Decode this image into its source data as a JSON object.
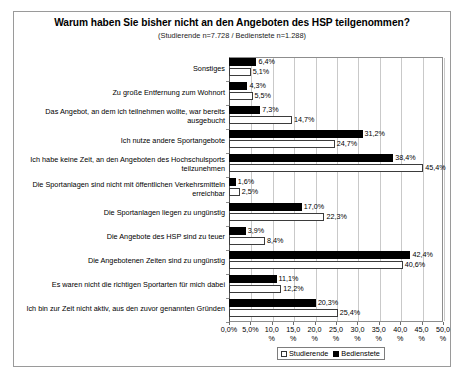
{
  "chart_data": {
    "type": "bar",
    "orientation": "horizontal",
    "title": "Warum haben Sie bisher nicht an den Angeboten des HSP teilgenommen?",
    "subtitle": "(Studierende n=7.728 / Bedienstete n=1.288)",
    "xlabel": "",
    "ylabel": "",
    "xlim": [
      0,
      50
    ],
    "grid": true,
    "legend_position": "bottom",
    "value_suffix": "%",
    "decimal_separator": ",",
    "categories": [
      "Sonstiges",
      "Zu große Entfernung zum Wohnort",
      "Das Angebot, an dem ich teilnehmen wollte, war bereits ausgebucht",
      "Ich nutze andere Sportangebote",
      "Ich habe keine Zeit, an den Angeboten des Hochschulsports teilzunehmen",
      "Die Sportanlagen sind nicht mit öffentlichen Verkehrsmitteln erreichbar",
      "Die Sportanlagen liegen zu ungünstig",
      "Die Angebote des HSP sind zu teuer",
      "Die Angebotenen Zeiten sind zu ungünstig",
      "Es waren nicht die richtigen Sportarten für mich dabei",
      "Ich bin zur Zeit nicht aktiv, aus den zuvor genannten Gründen"
    ],
    "series": [
      {
        "name": "Bedienstete",
        "color": "#000000",
        "values": [
          6.4,
          4.3,
          7.3,
          31.2,
          38.4,
          1.6,
          17.0,
          3.9,
          42.4,
          11.1,
          20.3
        ],
        "labels": [
          "6,4%",
          "4,3%",
          "7,3%",
          "31,2%",
          "38,4%",
          "1,6%",
          "17,0%",
          "3,9%",
          "42,4%",
          "11,1%",
          "20,3%"
        ]
      },
      {
        "name": "Studierende",
        "color": "#ffffff",
        "values": [
          5.1,
          5.5,
          14.7,
          24.7,
          45.4,
          2.5,
          22.3,
          8.4,
          40.6,
          12.2,
          25.4
        ],
        "labels": [
          "5,1%",
          "5,5%",
          "14,7%",
          "24,7%",
          "45,4%",
          "2,5%",
          "22,3%",
          "8,4%",
          "40,6%",
          "12,2%",
          "25,4%"
        ]
      }
    ],
    "xticks": [
      0,
      5,
      10,
      15,
      20,
      25,
      30,
      35,
      40,
      45,
      50
    ],
    "xticklabels": [
      "0,0%",
      "5,0%",
      "10,0\n%",
      "15,0\n%",
      "20,0\n%",
      "25,0\n%",
      "30,0\n%",
      "35,0\n%",
      "40,0\n%",
      "45,0\n%",
      "50,0\n%"
    ],
    "legend_entries": [
      {
        "label": "Studierende",
        "swatch": "open"
      },
      {
        "label": "Bedienstete",
        "swatch": "filled"
      }
    ]
  }
}
